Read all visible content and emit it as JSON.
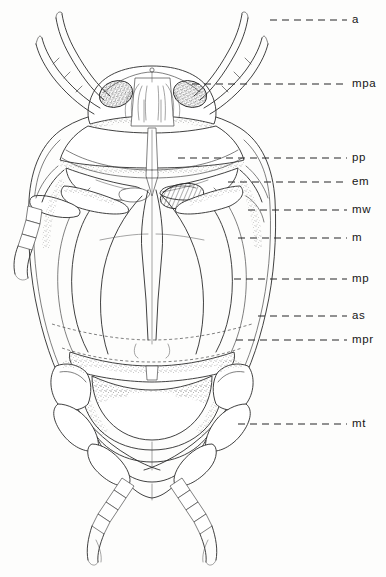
{
  "figure": {
    "background_color": "#fdfdfc",
    "ink_color": "#2b2b2b",
    "width": 386,
    "height": 577
  },
  "labels": [
    {
      "key": "a",
      "text": "a",
      "meaning": "antenna",
      "y": 20,
      "leader_x1": 270,
      "leader_x2": 347,
      "text_x": 352
    },
    {
      "key": "mpa",
      "text": "mpa",
      "meaning": "maxillary palp",
      "y": 84,
      "leader_x1": 192,
      "leader_x2": 347,
      "text_x": 352
    },
    {
      "key": "pp",
      "text": "pp",
      "meaning": "prosternal process",
      "y": 158,
      "leader_x1": 178,
      "leader_x2": 347,
      "text_x": 352
    },
    {
      "key": "em",
      "text": "em",
      "meaning": "epimeron",
      "y": 182,
      "leader_x1": 228,
      "leader_x2": 347,
      "text_x": 352
    },
    {
      "key": "mw",
      "text": "mw",
      "meaning": "mesowing / mesothorax",
      "y": 210,
      "leader_x1": 248,
      "leader_x2": 347,
      "text_x": 352
    },
    {
      "key": "m",
      "text": "m",
      "meaning": "mesosternum",
      "y": 238,
      "leader_x1": 238,
      "leader_x2": 347,
      "text_x": 352
    },
    {
      "key": "mp",
      "text": "mp",
      "meaning": "metasternum plate",
      "y": 279,
      "leader_x1": 234,
      "leader_x2": 347,
      "text_x": 352
    },
    {
      "key": "as",
      "text": "as",
      "meaning": "abdominal sternite",
      "y": 316,
      "leader_x1": 258,
      "leader_x2": 347,
      "text_x": 352
    },
    {
      "key": "mpr",
      "text": "mpr",
      "meaning": "metacoxal process",
      "y": 340,
      "leader_x1": 236,
      "leader_x2": 347,
      "text_x": 352
    },
    {
      "key": "mt",
      "text": "mt",
      "meaning": "metatrochanter",
      "y": 424,
      "leader_x1": 238,
      "leader_x2": 347,
      "text_x": 352
    }
  ],
  "caption": {
    "clipped_text": ""
  },
  "structures": {
    "head": "head capsule with two stippled compound eyes and central labrum-clypeus complex",
    "antennae": "two long segmented antennae sweeping outward and upward",
    "palps": "paired segmented maxillary palps beside the antennae",
    "thorax": "broad prothorax with stippled lateral margins",
    "elytra": "paired elytra forming the large mid-body shield",
    "abdomen": "nested abdominal sternites with stippled margins",
    "legs": "three pairs of segmented legs with tarsi and terminal claws"
  }
}
